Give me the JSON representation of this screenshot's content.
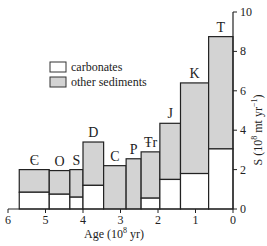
{
  "chart_data": {
    "type": "bar",
    "stacked": true,
    "title": "",
    "xlabel": "Age (10^8 yr)",
    "ylabel": "S (10^8 mt yr^-1)",
    "xlim": [
      6,
      0
    ],
    "ylim": [
      0,
      10
    ],
    "x_ticks": [
      6,
      5,
      4,
      3,
      2,
      1,
      0
    ],
    "y_ticks": [
      0,
      2,
      4,
      6,
      8,
      10
    ],
    "y_axis_position": "right",
    "grid": false,
    "legend": {
      "position": "upper-left",
      "entries": [
        "carbonates",
        "other sediments"
      ]
    },
    "categories": [
      "Є",
      "O",
      "S",
      "D",
      "C",
      "P",
      "Ŧr",
      "J",
      "K",
      "T"
    ],
    "periods": [
      {
        "label": "Є",
        "age_start": 5.7,
        "age_end": 4.9
      },
      {
        "label": "O",
        "age_start": 4.9,
        "age_end": 4.35
      },
      {
        "label": "S",
        "age_start": 4.35,
        "age_end": 4.0
      },
      {
        "label": "D",
        "age_start": 4.0,
        "age_end": 3.45
      },
      {
        "label": "C",
        "age_start": 3.45,
        "age_end": 2.85
      },
      {
        "label": "P",
        "age_start": 2.85,
        "age_end": 2.45
      },
      {
        "label": "Ŧr",
        "age_start": 2.45,
        "age_end": 1.95
      },
      {
        "label": "J",
        "age_start": 1.95,
        "age_end": 1.4
      },
      {
        "label": "K",
        "age_start": 1.4,
        "age_end": 0.65
      },
      {
        "label": "T",
        "age_start": 0.65,
        "age_end": 0.0
      }
    ],
    "series": [
      {
        "name": "carbonates",
        "color": "#ffffff",
        "values": [
          0.85,
          0.75,
          0.6,
          1.2,
          0.0,
          0.0,
          0.55,
          1.5,
          1.8,
          3.05
        ]
      },
      {
        "name": "other sediments",
        "color": "#d3d3d3",
        "values": [
          1.15,
          1.2,
          1.4,
          2.2,
          2.2,
          2.55,
          2.35,
          2.85,
          4.6,
          5.7
        ]
      }
    ],
    "totals": [
      2.0,
      1.95,
      2.0,
      3.4,
      2.2,
      2.55,
      2.9,
      4.35,
      6.4,
      8.75
    ]
  },
  "labels": {
    "xlabel_main": "Age (10",
    "xlabel_sup": "8",
    "xlabel_tail": " yr)",
    "ylabel_main": "S (10",
    "ylabel_sup": "8",
    "ylabel_mid": " mt yr",
    "ylabel_sup2": "−1",
    "ylabel_tail": ")",
    "legend_carbonates": "carbonates",
    "legend_other": "other sediments"
  }
}
